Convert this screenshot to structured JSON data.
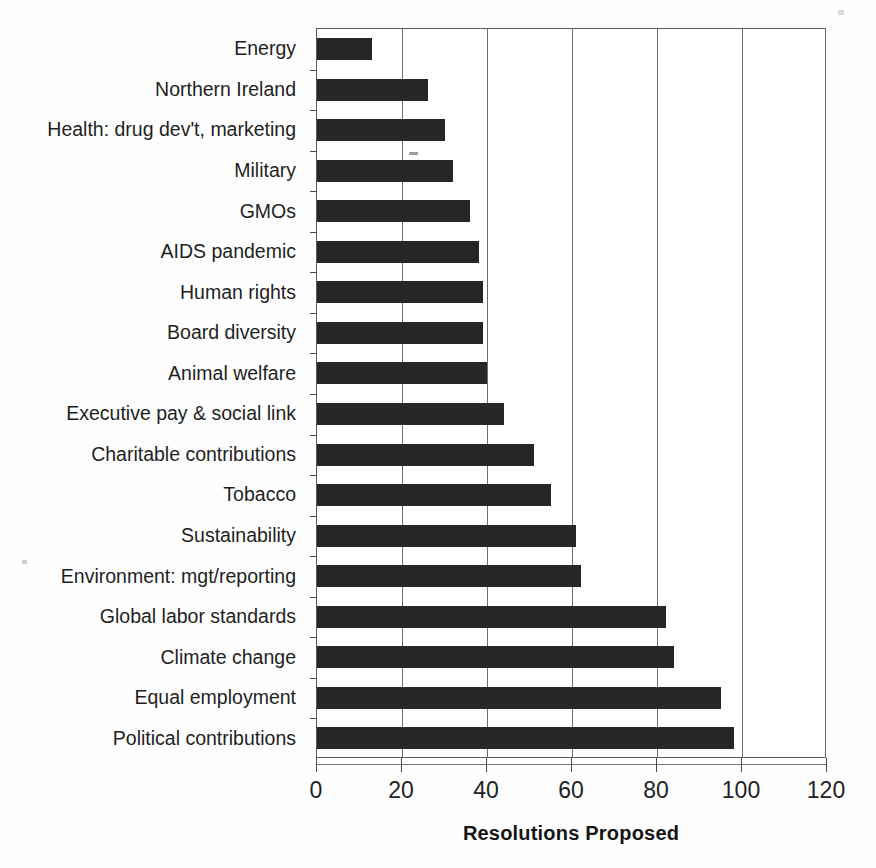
{
  "chart_data": {
    "type": "bar",
    "orientation": "horizontal",
    "title": "",
    "xlabel": "Resolutions Proposed",
    "ylabel": "",
    "xlim": [
      0,
      120
    ],
    "xticks": [
      0,
      20,
      40,
      60,
      80,
      100,
      120
    ],
    "xtick_labels": [
      "0",
      "20",
      "40",
      "60",
      "80",
      "100",
      "120"
    ],
    "grid": true,
    "grid_axis": "x",
    "legend": false,
    "bar_color": "#262626",
    "categories": [
      "Energy",
      "Northern Ireland",
      "Health: drug dev't, marketing",
      "Military",
      "GMOs",
      "AIDS pandemic",
      "Human rights",
      "Board diversity",
      "Animal welfare",
      "Executive pay & social link",
      "Charitable contributions",
      "Tobacco",
      "Sustainability",
      "Environment: mgt/reporting",
      "Global labor standards",
      "Climate change",
      "Equal employment",
      "Political contributions"
    ],
    "values": [
      13,
      26,
      30,
      32,
      36,
      38,
      39,
      39,
      40,
      44,
      51,
      55,
      61,
      62,
      82,
      84,
      95,
      98
    ]
  }
}
